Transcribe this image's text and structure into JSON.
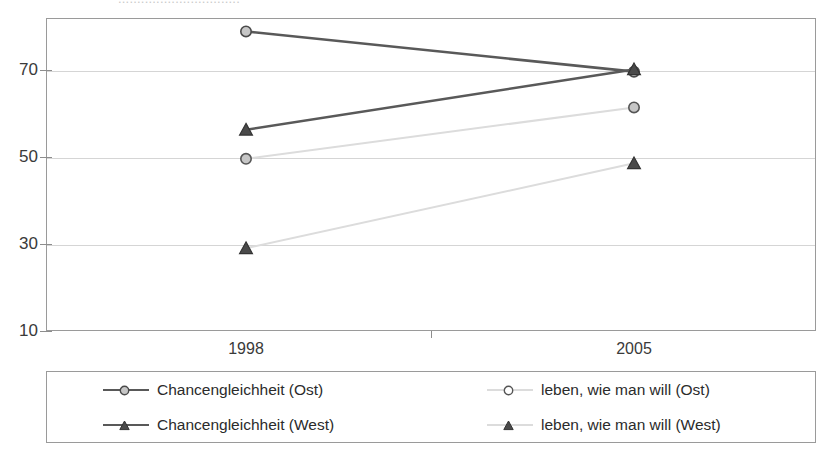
{
  "top_partial_text": "................................",
  "chart_data": {
    "type": "line",
    "title": "",
    "subtitle": "",
    "xlabel": "",
    "ylabel": "",
    "categories": [
      "1998",
      "2005"
    ],
    "x": [
      1998,
      2005
    ],
    "ylim": [
      10,
      80
    ],
    "yticks": [
      10,
      30,
      50,
      70
    ],
    "ytick_labels": [
      "10",
      "30",
      "50",
      "70"
    ],
    "grid": true,
    "legend_position": "bottom",
    "series": [
      {
        "name": "Chancengleichheit  (Ost)",
        "values": [
          77,
          68
        ],
        "marker": "circle",
        "color": "#595959",
        "line_color": "#595959",
        "marker_fill": "#c6c6c6",
        "marker_stroke": "#4a4a4a"
      },
      {
        "name": "Chancengleichheit  (West)",
        "values": [
          55,
          68.5
        ],
        "marker": "triangle",
        "color": "#595959",
        "line_color": "#595959",
        "marker_fill": "#4a4a4a",
        "marker_stroke": "#333333"
      },
      {
        "name": "leben, wie man will (Ost)",
        "values": [
          48.5,
          60
        ],
        "marker": "circle",
        "color": "#dcdcdc",
        "line_color": "#dcdcdc",
        "marker_fill": "#c6c6c6",
        "marker_stroke": "#555555"
      },
      {
        "name": "leben, wie man will (West)",
        "values": [
          28.5,
          47.5
        ],
        "marker": "triangle",
        "color": "#dcdcdc",
        "line_color": "#dcdcdc",
        "marker_fill": "#4a4a4a",
        "marker_stroke": "#333333"
      }
    ]
  },
  "axes": {
    "x_tick_labels": [
      "1998",
      "2005"
    ],
    "y_tick_labels": [
      "70",
      "50",
      "30",
      "10"
    ]
  },
  "legend": {
    "entries": [
      {
        "label": "Chancengleichheit  (Ost)"
      },
      {
        "label": "leben, wie man will (Ost)"
      },
      {
        "label": "Chancengleichheit  (West)"
      },
      {
        "label": "leben, wie man will (West)"
      }
    ]
  },
  "colors": {
    "dark_line": "#595959",
    "light_line": "#dcdcdc",
    "frame": "#9a9a9a",
    "grid": "#d5d5d5",
    "text": "#2b2b2b"
  }
}
